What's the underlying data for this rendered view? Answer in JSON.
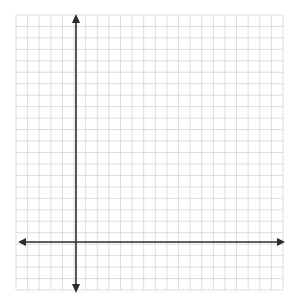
{
  "diagram": {
    "type": "coordinate-plane",
    "grid": {
      "left": 16,
      "top": 15,
      "right": 283,
      "bottom": 290,
      "columns": 23,
      "rows": 24,
      "line_color": "#d4d4d4"
    },
    "axes": {
      "color": "#2b2b2b",
      "x_axis": {
        "y": 242,
        "x_start": 18,
        "x_end": 285,
        "arrows": "both"
      },
      "y_axis": {
        "x": 76,
        "y_start": 14,
        "y_end": 293,
        "arrows": "both"
      }
    },
    "labels": []
  }
}
